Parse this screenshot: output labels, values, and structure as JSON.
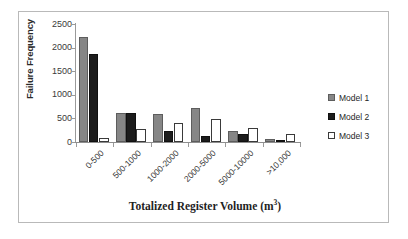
{
  "chart_data": {
    "type": "bar",
    "title": "",
    "xlabel": "Totalized Register Volume (m³)",
    "ylabel": "Failure Frequency",
    "categories": [
      "0-500",
      "500-1000",
      "1000-2000",
      "2000-5000",
      "5000-10000",
      ">10,000"
    ],
    "series": [
      {
        "name": "Model 1",
        "color": "#868686",
        "values": [
          2230,
          620,
          600,
          730,
          230,
          70
        ]
      },
      {
        "name": "Model 2",
        "color": "#1c1c1c",
        "values": [
          1870,
          620,
          230,
          130,
          170,
          20
        ]
      },
      {
        "name": "Model 3",
        "color": "#ffffff",
        "values": [
          80,
          270,
          400,
          480,
          300,
          180
        ]
      }
    ],
    "ylim": [
      0,
      2500
    ],
    "yticks": [
      0,
      500,
      1000,
      1500,
      2000,
      2500
    ],
    "ytick_labels": [
      "0",
      "500",
      "1000",
      "1500",
      "2000",
      "2500"
    ],
    "grid": false,
    "legend_position": "right",
    "xtick_rotation": -45
  },
  "axis": {
    "y_title": "Failure Frequency",
    "x_title_prefix": "Totalized Register Volume (m",
    "x_title_sup": "3",
    "x_title_suffix": ")"
  },
  "legend": {
    "items": [
      {
        "label": "Model 1"
      },
      {
        "label": "Model 2"
      },
      {
        "label": "Model 3"
      }
    ]
  }
}
